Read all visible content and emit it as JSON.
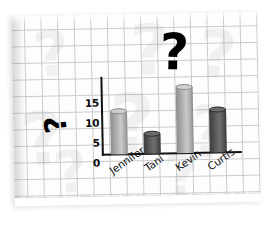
{
  "page": {
    "medium": "graph-paper-sheet",
    "background_color": "#fdfdfd",
    "grid_color": "#a9acb0"
  },
  "annotations": {
    "main_question_mark": "?",
    "side_question_mark": "?"
  },
  "watermarks": {
    "glyph": "?",
    "items": [
      {
        "char": "?",
        "left": 22,
        "top": 8,
        "size": 62
      },
      {
        "char": "?",
        "left": 118,
        "top": 2,
        "size": 70
      },
      {
        "char": "?",
        "left": 186,
        "top": 10,
        "size": 66
      },
      {
        "char": "?",
        "left": 8,
        "top": 86,
        "size": 74
      },
      {
        "char": "?",
        "left": 96,
        "top": 70,
        "size": 80
      },
      {
        "char": "?",
        "left": 176,
        "top": 84,
        "size": 72
      },
      {
        "char": "?",
        "left": 40,
        "top": 128,
        "size": 58
      },
      {
        "char": "?",
        "left": 150,
        "top": 132,
        "size": 60
      }
    ]
  },
  "chart_data": {
    "type": "bar",
    "title": "",
    "xlabel": "",
    "ylabel": "",
    "categories": [
      "Jennifer",
      "Tani",
      "Kevin",
      "Curtis"
    ],
    "values": [
      10,
      5,
      15,
      10
    ],
    "series": [
      {
        "name": "",
        "values": [
          10,
          5,
          15,
          10
        ]
      }
    ],
    "ylim": [
      0,
      17
    ],
    "yticks": [
      15,
      10,
      5,
      0
    ],
    "ytick_labels": [
      "15",
      "10",
      "5",
      "0"
    ],
    "grid": true,
    "legend": "none",
    "bar_styles": [
      "light",
      "dark",
      "light",
      "dark"
    ],
    "bar_colors": {
      "light": "#b6b6b6",
      "dark": "#5a5a5a"
    },
    "axis_color": "#121212"
  }
}
